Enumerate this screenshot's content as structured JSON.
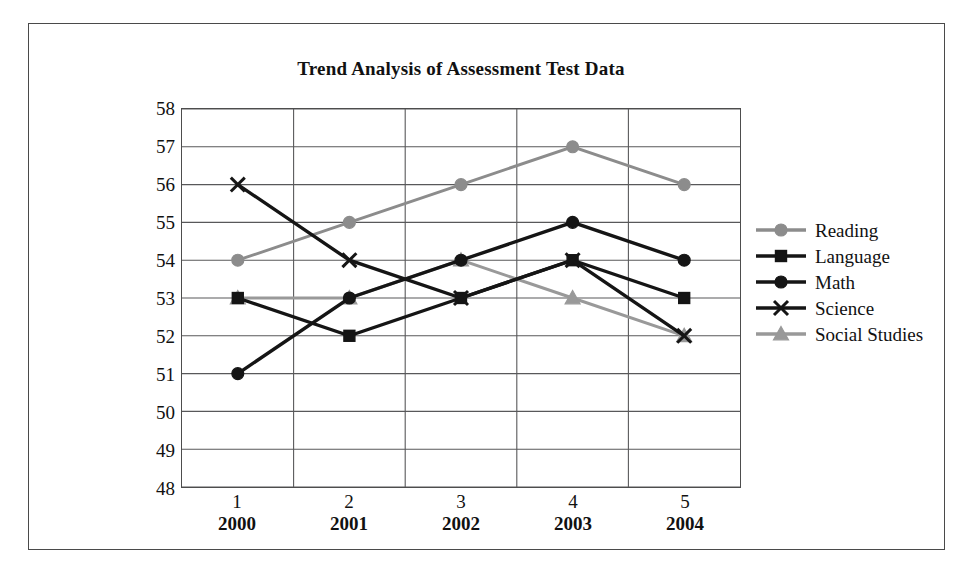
{
  "frame": {
    "border_color": "#4a4a4a"
  },
  "chart_data": {
    "type": "line",
    "title": "Trend Analysis of Assessment Test Data",
    "xlabel": "",
    "ylabel": "",
    "categories": [
      "1",
      "2",
      "3",
      "4",
      "5"
    ],
    "category_sublabels": [
      "2000",
      "2001",
      "2002",
      "2003",
      "2004"
    ],
    "ylim": [
      48,
      58
    ],
    "ytick_labels": [
      "58",
      "57",
      "56",
      "55",
      "54",
      "53",
      "52",
      "51",
      "50",
      "49",
      "48"
    ],
    "grid": true,
    "legend_position": "right",
    "series": [
      {
        "name": "Reading",
        "values": [
          54,
          55,
          56,
          57,
          56
        ],
        "color": "#8c8c8c",
        "marker": "circle-gray-icon"
      },
      {
        "name": "Language",
        "values": [
          53,
          52,
          53,
          54,
          53
        ],
        "color": "#151515",
        "marker": "square-black-icon"
      },
      {
        "name": "Math",
        "values": [
          51,
          53,
          54,
          55,
          54
        ],
        "color": "#151515",
        "marker": "circle-black-icon"
      },
      {
        "name": "Science",
        "values": [
          56,
          54,
          53,
          54,
          52
        ],
        "color": "#151515",
        "marker": "x-black-icon"
      },
      {
        "name": "Social Studies",
        "values": [
          53,
          53,
          54,
          53,
          52
        ],
        "color": "#999999",
        "marker": "triangle-gray-icon"
      }
    ]
  }
}
